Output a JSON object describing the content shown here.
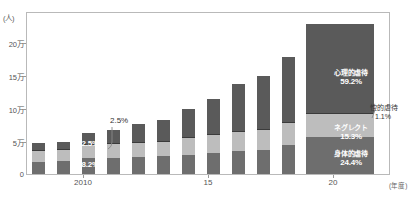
{
  "chart_data": {
    "type": "bar",
    "title": "",
    "subtype": "stacked-bar",
    "ylabel": "(人)",
    "xlabel": "(年度)",
    "ylim": [
      0,
      220000
    ],
    "grid": false,
    "legend": "in-chart annotations",
    "y_ticks": [
      {
        "label": "20万",
        "value": 200000
      },
      {
        "label": "15万",
        "value": 150000
      },
      {
        "label": "10万",
        "value": 100000
      },
      {
        "label": "5万",
        "value": 50000
      },
      {
        "label": "0",
        "value": 0
      }
    ],
    "x_ticks": [
      {
        "label": "2010",
        "index": 2
      },
      {
        "label": "15",
        "index": 7
      },
      {
        "label": "20",
        "index": 12
      }
    ],
    "categories": [
      "2008",
      "2009",
      "2010",
      "2011",
      "2012",
      "2013",
      "2014",
      "2015",
      "2016",
      "2017",
      "2018",
      "2019",
      "2020"
    ],
    "series": [
      {
        "name": "身体的虐待",
        "key": "phys",
        "color": "#6e6e6e",
        "values": [
          16000,
          17400,
          21600,
          21900,
          23600,
          24200,
          26300,
          28600,
          31900,
          33200,
          40200,
          49200,
          50000
        ]
      },
      {
        "name": "ネグレクト",
        "key": "negl",
        "color": "#bdbdbd",
        "values": [
          15900,
          15200,
          18400,
          18800,
          19300,
          19600,
          22400,
          24400,
          25800,
          26800,
          29300,
          33300,
          31400
        ]
      },
      {
        "name": "性的虐待",
        "key": "sex",
        "color": "#3b3b3b",
        "values": [
          1300,
          1300,
          1400,
          1500,
          1400,
          1600,
          1500,
          1500,
          1600,
          1500,
          1700,
          2100,
          2200
        ]
      },
      {
        "name": "心理的虐待",
        "key": "psy",
        "color": "#5a5a5a",
        "values": [
          9100,
          10300,
          15100,
          17600,
          23600,
          28300,
          38800,
          48700,
          63200,
          72200,
          88400,
          109100,
          121300
        ]
      }
    ],
    "bar_annotations": {
      "year_2010": {
        "index": 2,
        "phys": "38.2%",
        "negl": "32.5%",
        "psy": "26.7%",
        "sex_callout": "2.5%"
      },
      "year_2020": {
        "index": 12,
        "phys_name": "身体的虐待",
        "phys_pct": "24.4%",
        "negl_name": "ネグレクト",
        "negl_pct": "15.3%",
        "psy_name": "心理的虐待",
        "psy_pct": "59.2%",
        "sex_name": "性的虐待",
        "sex_pct": "1.1%"
      }
    }
  },
  "axes": {
    "y_unit": "(人)",
    "x_unit": "(年度)",
    "y_tick_labels": [
      "20万",
      "15万",
      "10万",
      "5万",
      "0"
    ],
    "x_tick_labels": [
      "2010",
      "15",
      "20"
    ]
  },
  "labels": {
    "y2010_psy": "26.7%",
    "y2010_negl": "32.5%",
    "y2010_phys": "38.2%",
    "y2010_sex": "2.5%",
    "y2020_psy_name": "心理的虐待",
    "y2020_psy_pct": "59.2%",
    "y2020_negl_name": "ネグレクト",
    "y2020_negl_pct": "15.3%",
    "y2020_phys_name": "身体的虐待",
    "y2020_phys_pct": "24.4%",
    "y2020_sex_name": "性的虐待",
    "y2020_sex_pct": "1.1%"
  },
  "colors": {
    "physical": "#6e6e6e",
    "neglect": "#bdbdbd",
    "sexual": "#3b3b3b",
    "psychological": "#5a5a5a",
    "frame": "#b9b9b9",
    "text": "#555555"
  }
}
